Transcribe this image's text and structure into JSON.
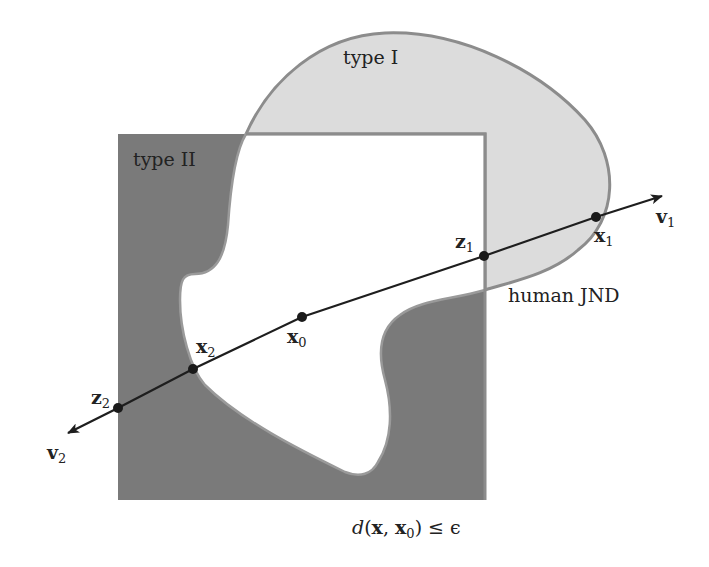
{
  "diagram": {
    "colors": {
      "background": "#ffffff",
      "type_ii_fill": "#7a7a7a",
      "type_i_fill": "#dcdcdc",
      "boundary_stroke": "#8c8c8c",
      "line": "#1e1e1e",
      "point": "#1a1a1a"
    },
    "regions": {
      "type_i": {
        "label": "type I"
      },
      "type_ii": {
        "label": "type II"
      },
      "human_jnd": {
        "label": "human JND"
      },
      "epsilon_ball": {
        "label_d": "d",
        "label_rest_open": "(",
        "label_x": "x",
        "label_comma": ", ",
        "label_x0": "x",
        "label_x0_sub": "0",
        "label_close": ") ≤ ϵ"
      }
    },
    "points": [
      {
        "id": "x1",
        "base": "x",
        "sub": "1"
      },
      {
        "id": "z1",
        "base": "z",
        "sub": "1"
      },
      {
        "id": "x0",
        "base": "x",
        "sub": "0"
      },
      {
        "id": "x2",
        "base": "x",
        "sub": "2"
      },
      {
        "id": "z2",
        "base": "z",
        "sub": "2"
      }
    ],
    "directions": [
      {
        "id": "v1",
        "base": "v",
        "sub": "1"
      },
      {
        "id": "v2",
        "base": "v",
        "sub": "2"
      }
    ]
  }
}
